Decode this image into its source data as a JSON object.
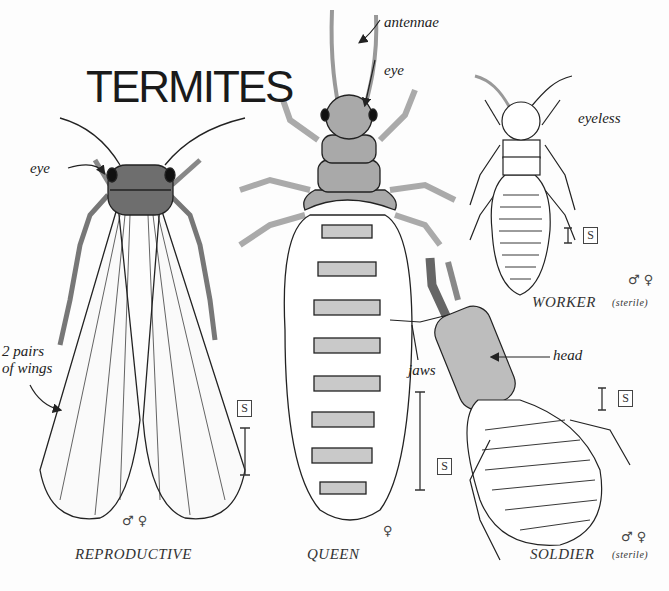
{
  "title": "TERMITES",
  "castes": [
    {
      "name": "REPRODUCTIVE",
      "sex": "♂ ♀",
      "note": ""
    },
    {
      "name": "QUEEN",
      "sex": "♀",
      "note": ""
    },
    {
      "name": "WORKER",
      "sex": "♂ ♀",
      "note": "(sterile)"
    },
    {
      "name": "SOLDIER",
      "sex": "♂ ♀",
      "note": "(sterile)"
    }
  ],
  "annotations": {
    "reproductive_eye": "eye",
    "wings_line1": "2 pairs",
    "wings_line2": "of wings",
    "queen_antennae": "antennae",
    "queen_eye": "eye",
    "worker_eyeless": "eyeless",
    "soldier_head": "head",
    "soldier_jaws": "jaws"
  },
  "scale_marker": "S",
  "colors": {
    "body_dark": "#6e6e6e",
    "body_mid": "#a9a9a9",
    "band": "#c9c9c9",
    "outline": "#222222",
    "background": "#fdfdfd"
  }
}
